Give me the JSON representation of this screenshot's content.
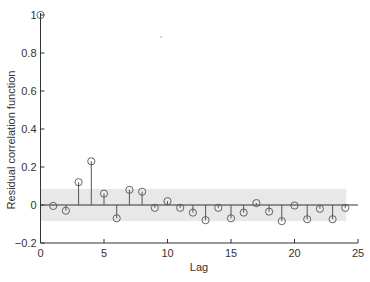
{
  "chart_data": {
    "type": "stem",
    "title": "",
    "xlabel": "Lag",
    "ylabel": "Residual correlation function",
    "xlim": [
      0,
      25
    ],
    "ylim": [
      -0.2,
      1.0
    ],
    "xticks": [
      0,
      5,
      10,
      15,
      20,
      25
    ],
    "yticks": [
      -0.2,
      0,
      0.2,
      0.4,
      0.6,
      0.8,
      1
    ],
    "ytick_labels": [
      "−0.2",
      "0",
      "0.2",
      "0.4",
      "0.6",
      "0.8",
      "1"
    ],
    "xtick_labels": [
      "0",
      "5",
      "10",
      "15",
      "20",
      "25"
    ],
    "grid": false,
    "legend": null,
    "confidence_band": {
      "lower": -0.085,
      "upper": 0.085,
      "x_range": [
        0,
        24
      ]
    },
    "lags": [
      0,
      1,
      2,
      3,
      4,
      5,
      6,
      7,
      8,
      9,
      10,
      11,
      12,
      13,
      14,
      15,
      16,
      17,
      18,
      19,
      20,
      21,
      22,
      23,
      24
    ],
    "values": [
      1.0,
      -0.005,
      -0.03,
      0.12,
      0.23,
      0.06,
      -0.07,
      0.08,
      0.07,
      -0.015,
      0.02,
      -0.015,
      -0.04,
      -0.08,
      -0.015,
      -0.07,
      -0.04,
      0.01,
      -0.035,
      -0.085,
      -0.003,
      -0.075,
      -0.02,
      -0.075,
      -0.015
    ]
  },
  "colors": {
    "stem": "#555555",
    "marker": "#555555",
    "band": "#e8e8e8",
    "axis": "#333333"
  }
}
